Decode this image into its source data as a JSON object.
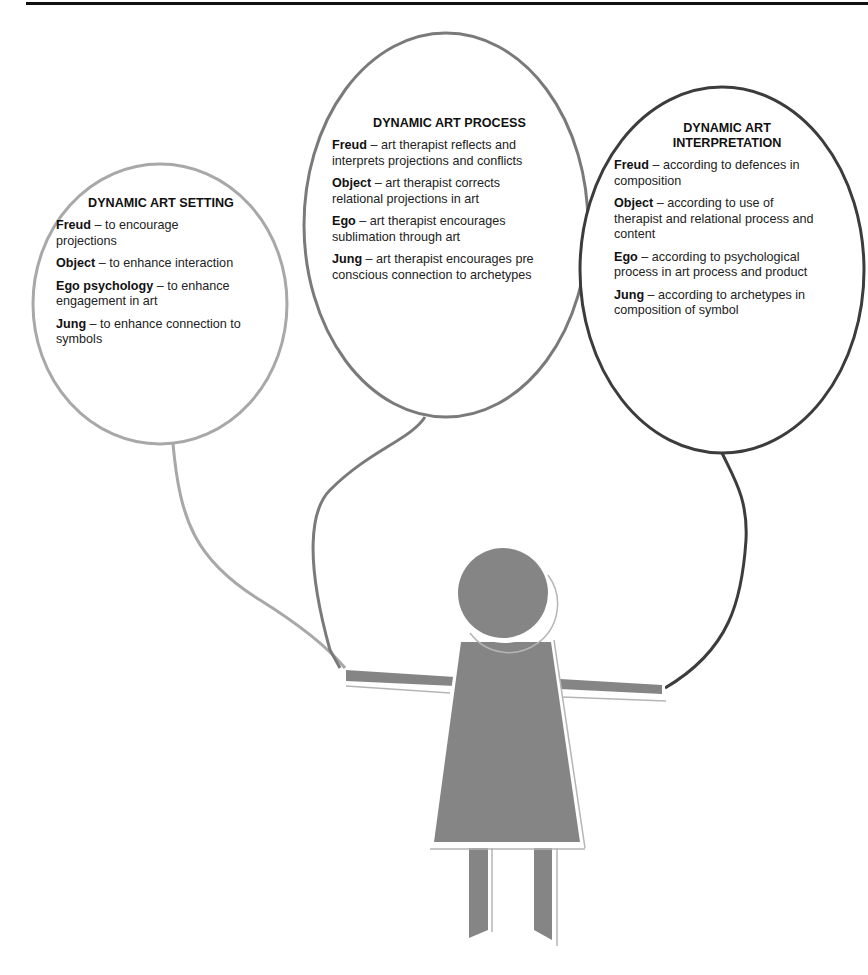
{
  "diagram": {
    "bubbles": [
      {
        "title": "DYNAMIC ART SETTING",
        "color": "#a8a8a8",
        "entries": [
          {
            "key": "Freud",
            "text": " – to encourage projections"
          },
          {
            "key": "Object",
            "text": " – to enhance interaction"
          },
          {
            "key": "Ego psychology",
            "text": " – to enhance engagement in art"
          },
          {
            "key": "Jung",
            "text": " – to enhance connection to symbols"
          }
        ]
      },
      {
        "title": "DYNAMIC ART PROCESS",
        "color": "#7a7a7a",
        "entries": [
          {
            "key": "Freud",
            "text": " – art therapist reflects and interprets projections and conflicts"
          },
          {
            "key": "Object",
            "text": " – art therapist corrects relational projections in art"
          },
          {
            "key": "Ego",
            "text": " – art therapist encourages sublimation through art"
          },
          {
            "key": "Jung",
            "text": " – art therapist encourages pre conscious connection to archetypes"
          }
        ]
      },
      {
        "title": "DYNAMIC ART INTERPRETATION",
        "color": "#3c3c3c",
        "entries": [
          {
            "key": "Freud",
            "text": " – according to defences in composition"
          },
          {
            "key": "Object",
            "text": " – according to use of therapist and relational process and content"
          },
          {
            "key": "Ego",
            "text": " – according to psychological process in art process and product"
          },
          {
            "key": "Jung",
            "text": " – according to archetypes in composition of symbol"
          }
        ]
      }
    ],
    "figure": {
      "fill": "#858585",
      "outline": "#ffffff",
      "shadow": "#b5b5b5"
    }
  }
}
